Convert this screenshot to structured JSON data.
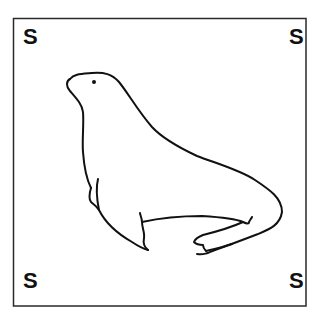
{
  "card": {
    "corner_letters": {
      "top_left": "S",
      "top_right": "S",
      "bottom_left": "S",
      "bottom_right": "S"
    },
    "illustration": "seal-line-drawing",
    "colors": {
      "background": "#ffffff",
      "ink": "#111111",
      "border": "#2a2a2a"
    }
  }
}
